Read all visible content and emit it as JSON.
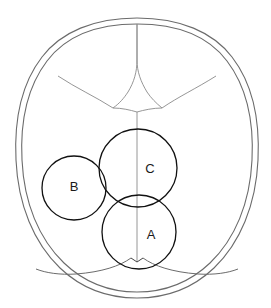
{
  "figure": {
    "background_color": "#ffffff",
    "width": 271,
    "height": 308
  },
  "colors": {
    "skull_outline": "#6b6b6b",
    "suture_line": "#8a8a8a",
    "circle_stroke": "#111111",
    "label_text": "#1a1a1a"
  },
  "skull": {
    "outer_outline_name": "skull-outer-contour",
    "inner_outline_name": "skull-inner-contour",
    "outer_path": "M 137 18 C 180 18 213 32 232 57 C 252 83 260 120 258 160 C 256 205 240 243 214 268 C 192 289 165 298 137 298 C 109 298 82 289 60 268 C 34 243 18 205 16 160 C 14 120 22 83 42 57 C 61 32 94 18 137 18 Z",
    "inner_path": "M 137 24 C 178 24 209 37 227 61 C 246 86 254 121 252 160 C 250 203 235 239 210 263 C 189 283 164 292 137 292 C 110 292 85 283 64 263 C 39 239 24 203 22 160 C 20 121 28 86 47 61 C 65 37 96 24 137 24 Z"
  },
  "sutures": [
    {
      "name": "sagittal-suture-anterior",
      "label": "sagittal suture (anterior segment)",
      "path": "M 137 24 L 137 60 C 137 72 134 82 128 92"
    },
    {
      "name": "sagittal-suture-midline",
      "label": "sagittal suture (midline to posterior fontanelle)",
      "path": "M 137 112 L 137 262"
    },
    {
      "name": "frontal-metopic-suture-left",
      "label": "frontal suture left branch",
      "path": "M 128 92 C 124 98 120 103 113 108 C 122 108 130 110 137 112"
    },
    {
      "name": "frontal-metopic-suture-right",
      "label": "frontal suture right branch",
      "path": "M 137 24 L 137 60 C 137 72 141 82 147 92 C 151 98 156 103 162 108 C 153 108 144 110 137 112"
    },
    {
      "name": "coronal-suture-left",
      "label": "left coronal suture",
      "path": "M 58 76 C 76 88 96 97 113 108"
    },
    {
      "name": "coronal-suture-right",
      "label": "right coronal suture",
      "path": "M 216 76 C 197 88 178 97 162 108"
    },
    {
      "name": "lambdoid-suture-left",
      "label": "left lambdoid suture",
      "path": "M 131 258 C 120 266 102 272 76 274 C 60 275 46 273 36 269"
    },
    {
      "name": "lambdoid-suture-right",
      "label": "right lambdoid suture",
      "path": "M 143 258 C 154 266 172 272 198 274 C 214 275 228 273 238 269"
    },
    {
      "name": "posterior-fontanelle-left-edge",
      "label": "posterior fontanelle left edge",
      "path": "M 137 262 L 131 258"
    },
    {
      "name": "posterior-fontanelle-right-edge",
      "label": "posterior fontanelle right edge",
      "path": "M 137 262 L 143 258"
    }
  ],
  "circles": [
    {
      "id": "B",
      "name": "circle-b",
      "label": "B",
      "cx": 74,
      "cy": 188,
      "r": 32,
      "label_x": 74,
      "label_y": 188
    },
    {
      "id": "C",
      "name": "circle-c",
      "label": "C",
      "cx": 138,
      "cy": 168,
      "r": 39,
      "label_x": 150,
      "label_y": 170
    },
    {
      "id": "A",
      "name": "circle-a",
      "label": "A",
      "cx": 139,
      "cy": 232,
      "r": 37,
      "label_x": 151,
      "label_y": 236
    }
  ]
}
